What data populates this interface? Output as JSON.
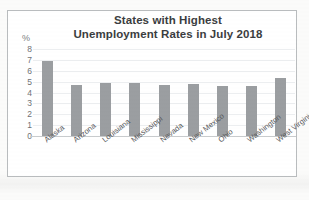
{
  "figure": {
    "frame_visible": true,
    "background": "#ffffff",
    "border_color": "#b9bcbe"
  },
  "chart_data": {
    "type": "bar",
    "title": "States with Highest Unemployment Rates in July 2018",
    "title_lines": [
      "States with Highest",
      "Unemployment Rates in July 2018"
    ],
    "xlabel": "",
    "ylabel": "%",
    "categories": [
      "Alaska",
      "Arizona",
      "Louisiana",
      "Mississippi",
      "Nevada",
      "New Mexico",
      "Ohio",
      "Washington",
      "West Virginia"
    ],
    "values": [
      6.9,
      4.7,
      4.9,
      4.9,
      4.7,
      4.8,
      4.6,
      4.6,
      5.3
    ],
    "ylim": [
      0,
      8
    ],
    "ytick_labels": [
      "8",
      "7",
      "6",
      "5",
      "4",
      "3",
      "2",
      "1",
      "0"
    ],
    "ytick_values": [
      8,
      7,
      6,
      5,
      4,
      3,
      2,
      1,
      0
    ],
    "grid": true,
    "grid_axis": "y",
    "legend": false,
    "bar_color": "#9b9ea1",
    "axis_color": "#c9ccce",
    "text_color": "#3b3d40",
    "tick_label_rotation": -38
  }
}
